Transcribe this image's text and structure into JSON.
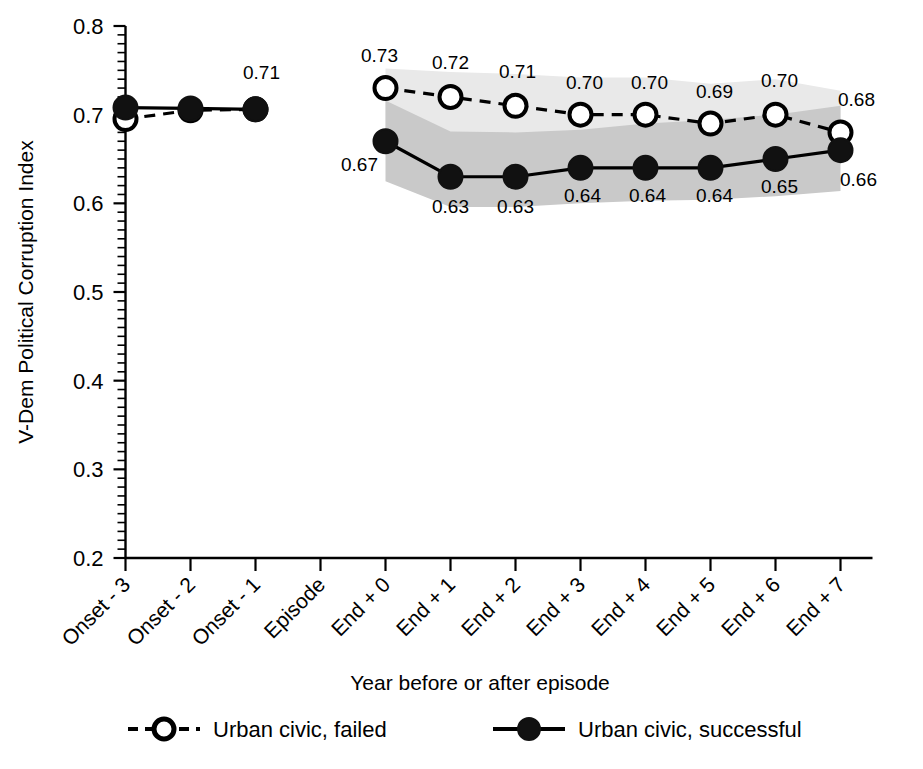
{
  "chart_data": {
    "type": "line",
    "title": "",
    "xlabel": "Year before or after episode",
    "ylabel": "V-Dem Political Corruption Index",
    "ylim": [
      0.2,
      0.8
    ],
    "ytick_labels": [
      "0.2",
      "0.3",
      "0.4",
      "0.5",
      "0.6",
      "0.7",
      "0.8"
    ],
    "ytick_values": [
      0.2,
      0.3,
      0.4,
      0.5,
      0.6,
      0.7,
      0.8
    ],
    "grid": false,
    "legend_position": "bottom",
    "minor_ticks": true,
    "categories": [
      "Onset - 3",
      "Onset - 2",
      "Onset - 1",
      "Episode",
      "End + 0",
      "End + 1",
      "End + 2",
      "End + 3",
      "End + 4",
      "End + 5",
      "End + 6",
      "End + 7"
    ],
    "series": [
      {
        "name": "Urban civic, failed",
        "marker": "open-circle",
        "line_style": "dashed",
        "values": [
          0.695,
          0.705,
          0.706,
          null,
          0.73,
          0.72,
          0.71,
          0.7,
          0.7,
          0.69,
          0.7,
          0.68
        ],
        "labels": [
          "",
          "",
          "",
          "",
          "0.73",
          "0.72",
          "0.71",
          "0.70",
          "0.70",
          "0.69",
          "0.70",
          "0.68"
        ],
        "band_color": "#e9e9e9",
        "band_lower": [
          null,
          null,
          null,
          null,
          0.672,
          0.665,
          0.663,
          0.661,
          0.672,
          0.666,
          0.668,
          0.66
        ],
        "band_upper": [
          null,
          null,
          null,
          null,
          0.752,
          0.748,
          0.746,
          0.742,
          0.742,
          0.735,
          0.74,
          0.727
        ]
      },
      {
        "name": "Urban civic, successful",
        "marker": "filled-circle",
        "line_style": "solid",
        "values": [
          0.708,
          0.707,
          0.706,
          null,
          0.67,
          0.63,
          0.63,
          0.64,
          0.64,
          0.64,
          0.65,
          0.66
        ],
        "labels": [
          "",
          "",
          "0.71",
          "",
          "0.67",
          "0.63",
          "0.63",
          "0.64",
          "0.64",
          "0.64",
          "0.65",
          "0.66"
        ],
        "band_color": "#c9c9c9",
        "band_lower": [
          null,
          null,
          null,
          null,
          0.625,
          0.596,
          0.596,
          0.6,
          0.603,
          0.604,
          0.608,
          0.614
        ],
        "band_upper": [
          null,
          null,
          null,
          null,
          0.716,
          0.681,
          0.68,
          0.683,
          0.69,
          0.694,
          0.7,
          0.71
        ]
      }
    ],
    "annotations": {
      "label_071": "0.71",
      "left_cluster_indices": [
        0,
        1,
        2
      ],
      "right_cluster_indices": [
        4,
        5,
        6,
        7,
        8,
        9,
        10,
        11
      ]
    }
  },
  "legend": {
    "entries": [
      {
        "label": "Urban civic, failed",
        "marker": "open-circle",
        "line_style": "dashed"
      },
      {
        "label": "Urban civic, successful",
        "marker": "filled-circle",
        "line_style": "solid"
      }
    ]
  },
  "colors": {
    "foreground": "#000000",
    "background": "#ffffff",
    "band_light": "#e9e9e9",
    "band_dark": "#c9c9c9"
  }
}
